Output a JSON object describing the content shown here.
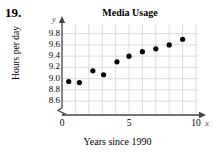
{
  "problem": {
    "number": "19."
  },
  "chart_data": {
    "type": "scatter",
    "title": "Media Usage",
    "xlabel": "Years since 1990",
    "ylabel": "Hours per day",
    "x_axis_letter": "x",
    "y_axis_letter": "y",
    "xlim": [
      0,
      10
    ],
    "ylim": [
      8.5,
      9.9
    ],
    "y_axis_break": true,
    "grid": true,
    "grid_color": "#cfcfcf",
    "point_color": "#000000",
    "xticks": [
      {
        "value": 0,
        "label": "0"
      },
      {
        "value": 5,
        "label": "5"
      },
      {
        "value": 10,
        "label": "10"
      }
    ],
    "x_gridlines": [
      1,
      2,
      3,
      4,
      5,
      6,
      7,
      8,
      9,
      10
    ],
    "yticks": [
      {
        "value": 9.8,
        "label": "9.8"
      },
      {
        "value": 9.6,
        "label": "9.6"
      },
      {
        "value": 9.4,
        "label": "9.4"
      },
      {
        "value": 9.2,
        "label": "9.2"
      },
      {
        "value": 9.0,
        "label": "9.0"
      },
      {
        "value": 8.8,
        "label": "8.8"
      },
      {
        "value": 8.6,
        "label": "8.6"
      }
    ],
    "x": [
      0.5,
      1.3,
      2.3,
      3.1,
      4.1,
      5.0,
      6.0,
      7.0,
      8.0,
      9.0
    ],
    "values": [
      8.95,
      8.93,
      9.14,
      9.07,
      9.3,
      9.4,
      9.48,
      9.53,
      9.6,
      9.7
    ],
    "points": [
      {
        "x": 0.5,
        "y": 8.95
      },
      {
        "x": 1.3,
        "y": 8.93
      },
      {
        "x": 2.3,
        "y": 9.14
      },
      {
        "x": 3.1,
        "y": 9.07
      },
      {
        "x": 4.1,
        "y": 9.3
      },
      {
        "x": 5.0,
        "y": 9.4
      },
      {
        "x": 6.0,
        "y": 9.48
      },
      {
        "x": 7.0,
        "y": 9.53
      },
      {
        "x": 8.0,
        "y": 9.6
      },
      {
        "x": 9.0,
        "y": 9.7
      }
    ]
  }
}
